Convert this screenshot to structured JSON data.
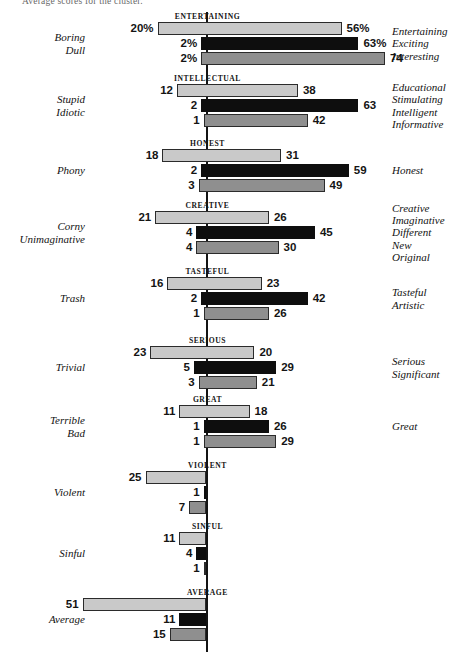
{
  "caption": "Average scores for the cluster.",
  "colors": {
    "light": "#c9c9c9",
    "dark": "#0e0e0e",
    "mid": "#8f8f8f",
    "axis": "#141414",
    "text": "#121212"
  },
  "chart_data": {
    "type": "bar",
    "title": "Average scores for the cluster.",
    "subtype": "diverging-bidirectional-grouped",
    "xlabel": "",
    "ylabel": "",
    "orientation": "horizontal",
    "grid": false,
    "legend_position": "none",
    "axis_zero": 0,
    "xlim": [
      -55,
      80
    ],
    "series_names": [
      "light",
      "dark",
      "mid"
    ],
    "groups": [
      {
        "name": "ENTERTAINING",
        "left_labels": [
          "Boring",
          "Dull"
        ],
        "right_labels": [
          "Entertaining",
          "Exciting",
          "Interesting"
        ],
        "bars": [
          {
            "series": "light",
            "left": 20,
            "right": 56,
            "left_text": "20%",
            "right_text": "56%"
          },
          {
            "series": "dark",
            "left": 2,
            "right": 63,
            "left_text": "2%",
            "right_text": "63%"
          },
          {
            "series": "mid",
            "left": 2,
            "right": 74,
            "left_text": "2%",
            "right_text": "74"
          }
        ]
      },
      {
        "name": "INTELLECTUAL",
        "left_labels": [
          "Stupid",
          "Idiotic"
        ],
        "right_labels": [
          "Educational",
          "Stimulating",
          "Intelligent",
          "Informative"
        ],
        "bars": [
          {
            "series": "light",
            "left": 12,
            "right": 38,
            "left_text": "12",
            "right_text": "38"
          },
          {
            "series": "dark",
            "left": 2,
            "right": 63,
            "left_text": "2",
            "right_text": "63"
          },
          {
            "series": "mid",
            "left": 1,
            "right": 42,
            "left_text": "1",
            "right_text": "42"
          }
        ]
      },
      {
        "name": "HONEST",
        "left_labels": [
          "Phony"
        ],
        "right_labels": [
          "Honest"
        ],
        "bars": [
          {
            "series": "light",
            "left": 18,
            "right": 31,
            "left_text": "18",
            "right_text": "31"
          },
          {
            "series": "dark",
            "left": 2,
            "right": 59,
            "left_text": "2",
            "right_text": "59"
          },
          {
            "series": "mid",
            "left": 3,
            "right": 49,
            "left_text": "3",
            "right_text": "49"
          }
        ]
      },
      {
        "name": "CREATIVE",
        "left_labels": [
          "Corny",
          "Unimaginative"
        ],
        "right_labels": [
          "Creative",
          "Imaginative",
          "Different",
          "New",
          "Original"
        ],
        "bars": [
          {
            "series": "light",
            "left": 21,
            "right": 26,
            "left_text": "21",
            "right_text": "26"
          },
          {
            "series": "dark",
            "left": 4,
            "right": 45,
            "left_text": "4",
            "right_text": "45"
          },
          {
            "series": "mid",
            "left": 4,
            "right": 30,
            "left_text": "4",
            "right_text": "30"
          }
        ]
      },
      {
        "name": "TASTEFUL",
        "left_labels": [
          "Trash"
        ],
        "right_labels": [
          "Tasteful",
          "Artistic"
        ],
        "bars": [
          {
            "series": "light",
            "left": 16,
            "right": 23,
            "left_text": "16",
            "right_text": "23"
          },
          {
            "series": "dark",
            "left": 2,
            "right": 42,
            "left_text": "2",
            "right_text": "42"
          },
          {
            "series": "mid",
            "left": 1,
            "right": 26,
            "left_text": "1",
            "right_text": "26"
          }
        ]
      },
      {
        "name": "SERIOUS",
        "left_labels": [
          "Trivial"
        ],
        "right_labels": [
          "Serious",
          "Significant"
        ],
        "bars": [
          {
            "series": "light",
            "left": 23,
            "right": 20,
            "left_text": "23",
            "right_text": "20"
          },
          {
            "series": "dark",
            "left": 5,
            "right": 29,
            "left_text": "5",
            "right_text": "29"
          },
          {
            "series": "mid",
            "left": 3,
            "right": 21,
            "left_text": "3",
            "right_text": "21"
          }
        ]
      },
      {
        "name": "GREAT",
        "left_labels": [
          "Terrible",
          "Bad"
        ],
        "right_labels": [
          "Great"
        ],
        "bars": [
          {
            "series": "light",
            "left": 11,
            "right": 18,
            "left_text": "11",
            "right_text": "18"
          },
          {
            "series": "dark",
            "left": 1,
            "right": 26,
            "left_text": "1",
            "right_text": "26"
          },
          {
            "series": "mid",
            "left": 1,
            "right": 29,
            "left_text": "1",
            "right_text": "29"
          }
        ]
      },
      {
        "name": "VIOLENT",
        "left_labels": [
          "Violent"
        ],
        "right_labels": [],
        "bars": [
          {
            "series": "light",
            "left": 25,
            "right": 0,
            "left_text": "25",
            "right_text": ""
          },
          {
            "series": "dark",
            "left": 1,
            "right": 0,
            "left_text": "1",
            "right_text": ""
          },
          {
            "series": "mid",
            "left": 7,
            "right": 0,
            "left_text": "7",
            "right_text": ""
          }
        ]
      },
      {
        "name": "SINFUL",
        "left_labels": [
          "Sinful"
        ],
        "right_labels": [],
        "bars": [
          {
            "series": "light",
            "left": 11,
            "right": 0,
            "left_text": "11",
            "right_text": ""
          },
          {
            "series": "dark",
            "left": 4,
            "right": 0,
            "left_text": "4",
            "right_text": ""
          },
          {
            "series": "mid",
            "left": 1,
            "right": 0,
            "left_text": "1",
            "right_text": ""
          }
        ]
      },
      {
        "name": "AVERAGE",
        "left_labels": [
          "Average"
        ],
        "right_labels": [],
        "bars": [
          {
            "series": "light",
            "left": 51,
            "right": 0,
            "left_text": "51",
            "right_text": ""
          },
          {
            "series": "dark",
            "left": 11,
            "right": 0,
            "left_text": "11",
            "right_text": ""
          },
          {
            "series": "mid",
            "left": 15,
            "right": 0,
            "left_text": "15",
            "right_text": ""
          }
        ]
      }
    ]
  }
}
